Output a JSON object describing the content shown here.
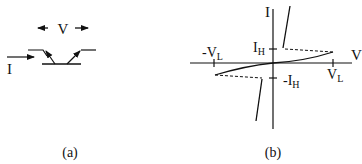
{
  "panel_a": {
    "caption": "(a)",
    "voltage_label": "V",
    "current_label": "I"
  },
  "panel_b": {
    "caption": "(b)",
    "x_axis_label": "V",
    "y_axis_label": "I",
    "tick_labels": {
      "neg_vl": "-V",
      "neg_vl_sub": "L",
      "vl": "V",
      "vl_sub": "L",
      "ih": "I",
      "ih_sub": "H",
      "neg_ih": "-I",
      "neg_ih_sub": "H"
    }
  },
  "colors": {
    "ink": "#111111",
    "background": "#ffffff"
  }
}
